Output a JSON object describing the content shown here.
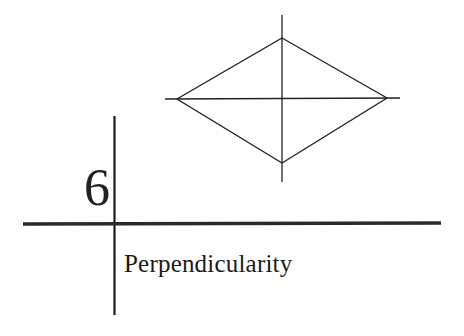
{
  "chapter": {
    "number": "6",
    "title": "Perpendicularity"
  },
  "figure": {
    "color": "#222222"
  }
}
